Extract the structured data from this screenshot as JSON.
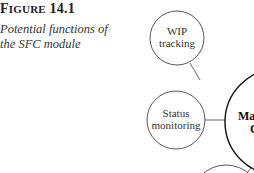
{
  "figure": {
    "label_prefix": "F",
    "label_smallcaps": "IGURE",
    "label_number": "14.1",
    "caption": "Potential functions of the SFC module"
  },
  "diagram": {
    "center": {
      "line1": "Mat",
      "line2": "C"
    },
    "nodes": [
      {
        "line1": "WIP",
        "line2": "tracking"
      },
      {
        "line1": "Status",
        "line2": "monitoring"
      }
    ],
    "colors": {
      "node_stroke": "#555555",
      "center_stroke": "#111111",
      "connector": "#666666"
    }
  }
}
